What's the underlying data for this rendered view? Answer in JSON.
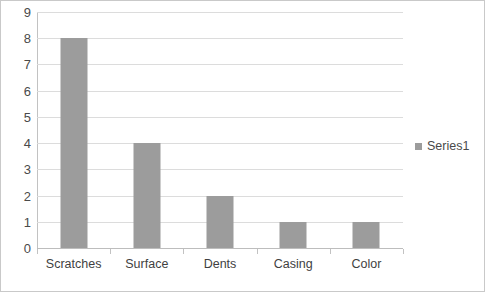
{
  "chart_data": {
    "type": "bar",
    "title": "",
    "subtitle": "",
    "xlabel": "",
    "ylabel": "",
    "categories": [
      "Scratches",
      "Surface",
      "Dents",
      "Casing",
      "Color"
    ],
    "series": [
      {
        "name": "Series1",
        "values": [
          8,
          4,
          2,
          1,
          1
        ]
      }
    ],
    "ylim": [
      0,
      9
    ],
    "ytick_step": 1,
    "yticks": [
      9,
      8,
      7,
      6,
      5,
      4,
      3,
      2,
      1,
      0
    ],
    "ytick_labels": [
      "9",
      "8",
      "7",
      "6",
      "5",
      "4",
      "3",
      "2",
      "1",
      "0"
    ],
    "grid": true,
    "grid_axis": "y",
    "legend": {
      "position": "right",
      "entries": [
        "Series1"
      ]
    },
    "colors": {
      "bar": "#9c9c9c",
      "gridline": "#dcdcdc",
      "axis": "#c2c2c2",
      "text": "#4a4a4a",
      "frame_border": "#c9c9c9",
      "background": "#ffffff"
    }
  }
}
